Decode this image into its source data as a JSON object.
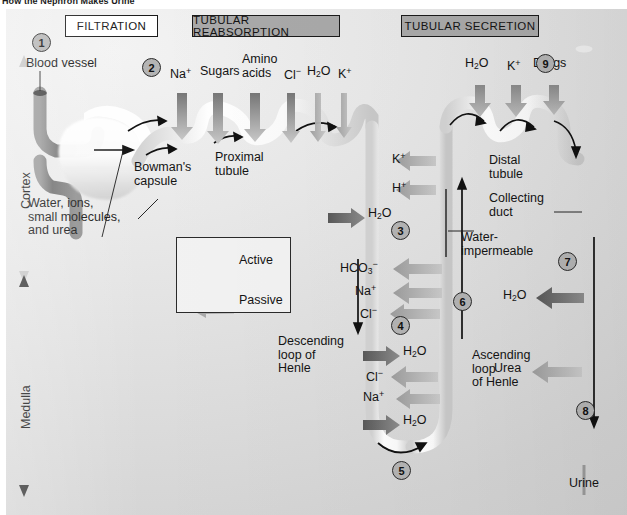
{
  "page": {
    "title": "How the Nephron Makes Urine"
  },
  "headers": [
    {
      "label": "FILTRATION",
      "style": "plain"
    },
    {
      "label": "TUBULAR REABSORPTION",
      "style": "fill"
    },
    {
      "label": "TUBULAR SECRETION",
      "style": "fill"
    }
  ],
  "region_axes": [
    {
      "label": "Cortex",
      "tone": "light"
    },
    {
      "label": "Medulla",
      "tone": "dark"
    }
  ],
  "structures": [
    {
      "name": "blood-vessel",
      "label": "Blood vessel"
    },
    {
      "name": "bowmans-capsule",
      "label": "Bowman's\ncapsule"
    },
    {
      "name": "filtrate-contents",
      "label": "Water, ions,\nsmall molecules,\nand urea"
    },
    {
      "name": "proximal-tubule",
      "label": "Proximal\ntubule"
    },
    {
      "name": "descending-loop",
      "label": "Descending\nloop of\nHenle"
    },
    {
      "name": "ascending-loop",
      "label": "Ascending\nloop\nof Henle"
    },
    {
      "name": "water-impermeable",
      "label": "Water-\nimpermeable"
    },
    {
      "name": "distal-tubule",
      "label": "Distal\ntubule"
    },
    {
      "name": "collecting-duct",
      "label": "Collecting\nduct"
    },
    {
      "name": "urine",
      "label": "Urine"
    }
  ],
  "legend": {
    "title": "",
    "entries": [
      {
        "label": "Active",
        "transport": "active",
        "arrows": 2
      },
      {
        "label": "Passive",
        "transport": "passive",
        "arrows": 2
      }
    ]
  },
  "steps": [
    {
      "n": "1",
      "at": "blood-vessel / glomerulus"
    },
    {
      "n": "2",
      "at": "proximal tubule reabsorption"
    },
    {
      "n": "3",
      "at": "upper loop of Henle"
    },
    {
      "n": "4",
      "at": "descending loop of Henle"
    },
    {
      "n": "5",
      "at": "bottom of loop of Henle"
    },
    {
      "n": "6",
      "at": "ascending loop of Henle"
    },
    {
      "n": "7",
      "at": "collecting duct water reabsorption"
    },
    {
      "n": "8",
      "at": "lower collecting duct"
    },
    {
      "n": "9",
      "at": "distal tubule secretion"
    }
  ],
  "transport_labels": {
    "proximal_reabsorbed": [
      {
        "text": "Na",
        "sup": "+",
        "transport": "active",
        "dir": "up"
      },
      {
        "text": "Sugars",
        "sup": "",
        "transport": "active",
        "dir": "up"
      },
      {
        "text": "Amino\nacids",
        "sup": "",
        "transport": "active",
        "dir": "up"
      },
      {
        "text": "Cl",
        "sup": "−",
        "transport": "active",
        "dir": "up"
      },
      {
        "text": "H2O",
        "sup": "",
        "transport": "passive",
        "dir": "up"
      },
      {
        "text": "K",
        "sup": "+",
        "transport": "passive",
        "dir": "up"
      }
    ],
    "upper_loop": [
      {
        "text": "K",
        "sup": "+",
        "transport": "passive",
        "dir": "left"
      },
      {
        "text": "H",
        "sup": "+",
        "transport": "passive",
        "dir": "left"
      },
      {
        "text": "H2O",
        "sup": "",
        "transport": "active",
        "dir": "right"
      }
    ],
    "ascending_loop_upper": [
      {
        "text": "HCO3",
        "sup": "−",
        "transport": "passive",
        "dir": "left"
      },
      {
        "text": "Na",
        "sup": "+",
        "transport": "passive",
        "dir": "left"
      },
      {
        "text": "Cl",
        "sup": "−",
        "transport": "passive",
        "dir": "left"
      }
    ],
    "loop_bottom": [
      {
        "text": "H2O",
        "sup": "",
        "transport": "active",
        "dir": "right"
      },
      {
        "text": "Cl",
        "sup": "−",
        "transport": "passive",
        "dir": "left"
      },
      {
        "text": "Na",
        "sup": "+",
        "transport": "passive",
        "dir": "left"
      },
      {
        "text": "H2O",
        "sup": "",
        "transport": "active",
        "dir": "right"
      }
    ],
    "distal_secreted": [
      {
        "text": "H2O",
        "sup": "",
        "transport": "passive",
        "dir": "down"
      },
      {
        "text": "K",
        "sup": "+",
        "transport": "passive",
        "dir": "down"
      },
      {
        "text": "Drugs",
        "sup": "",
        "transport": "passive",
        "dir": "down"
      }
    ],
    "collecting_duct": [
      {
        "text": "H2O",
        "sup": "",
        "transport": "active",
        "dir": "left"
      },
      {
        "text": "Urea",
        "sup": "",
        "transport": "passive",
        "dir": "left"
      }
    ]
  },
  "colors": {
    "header_fill": "#a9a9a9",
    "active_arrow": "#6e6e6e",
    "passive_arrow": "#b0b0b0",
    "tubule": "#fbfbfb",
    "vessel": "#8a8a8a",
    "background": "#dedede",
    "text": "#141414"
  }
}
